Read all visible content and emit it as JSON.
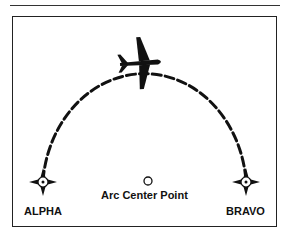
{
  "diagram": {
    "type": "DME arc flight path",
    "waypoints": [
      {
        "id": "alpha",
        "label": "ALPHA"
      },
      {
        "id": "bravo",
        "label": "BRAVO"
      }
    ],
    "center": {
      "label": "Arc Center Point"
    },
    "icons": {
      "aircraft": "airplane-icon",
      "waypoint": "waypoint-star-icon",
      "center": "circle-icon"
    },
    "colors": {
      "ink": "#111111",
      "background": "#ffffff"
    }
  }
}
